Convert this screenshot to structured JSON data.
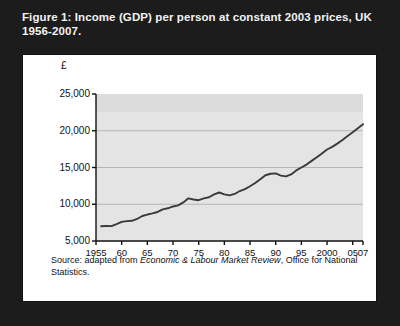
{
  "figure": {
    "caption": "Figure 1: Income (GDP) per person at constant 2003 prices, UK 1956-2007.",
    "source_prefix": "Source: adapted from ",
    "source_italic": "Economic & Labour Market Review",
    "source_suffix": ", Office for National Statistics."
  },
  "colors": {
    "frame": "#1c1c1c",
    "card": "#ffffff",
    "plot_background": "#e4e4e4",
    "plot_band": "#dcdcdc",
    "gridline": "#b5b5b5",
    "axis": "#111111",
    "line": "#3a3a3a",
    "caption_text": "#f2f2f2"
  },
  "chart_data": {
    "type": "line",
    "title": "Income (GDP) per person at constant 2003 prices, UK 1956-2007",
    "xlabel": "",
    "ylabel": "£",
    "ylim": [
      5000,
      25000
    ],
    "xlim": [
      1955,
      2007
    ],
    "grid": true,
    "legend": "none",
    "ytick_labels": [
      "25,000",
      "20,000",
      "15,000",
      "10,000",
      "5,000"
    ],
    "ytick_values": [
      25000,
      20000,
      15000,
      10000,
      5000
    ],
    "xtick_labels": [
      "1955",
      "60",
      "65",
      "70",
      "75",
      "80",
      "85",
      "90",
      "95",
      "2000",
      "05",
      "07"
    ],
    "xtick_values": [
      1955,
      1960,
      1965,
      1970,
      1975,
      1980,
      1985,
      1990,
      1995,
      2000,
      2005,
      2007
    ],
    "series": [
      {
        "name": "Income (GDP) per person, constant 2003 prices",
        "x": [
          1956,
          1957,
          1958,
          1959,
          1960,
          1961,
          1962,
          1963,
          1964,
          1965,
          1966,
          1967,
          1968,
          1969,
          1970,
          1971,
          1972,
          1973,
          1974,
          1975,
          1976,
          1977,
          1978,
          1979,
          1980,
          1981,
          1982,
          1983,
          1984,
          1985,
          1986,
          1987,
          1988,
          1989,
          1990,
          1991,
          1992,
          1993,
          1994,
          1995,
          1996,
          1997,
          1998,
          1999,
          2000,
          2001,
          2002,
          2003,
          2004,
          2005,
          2006,
          2007
        ],
        "values": [
          7000,
          7050,
          7030,
          7300,
          7600,
          7700,
          7750,
          8000,
          8400,
          8600,
          8750,
          8950,
          9300,
          9450,
          9700,
          9850,
          10250,
          10800,
          10650,
          10550,
          10800,
          10950,
          11350,
          11600,
          11350,
          11200,
          11400,
          11800,
          12050,
          12450,
          12900,
          13400,
          13950,
          14150,
          14200,
          13900,
          13800,
          14050,
          14600,
          15000,
          15400,
          15900,
          16400,
          16900,
          17450,
          17800,
          18250,
          18750,
          19300,
          19800,
          20350,
          20900
        ]
      }
    ]
  }
}
